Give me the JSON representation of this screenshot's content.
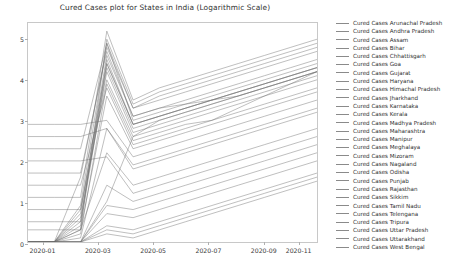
{
  "chart_data": {
    "type": "line",
    "title": "Cured Cases plot for States in India (Logarithmic Scale)",
    "xlabel": "",
    "ylabel": "",
    "ylim": [
      0,
      5.4
    ],
    "yticks": [
      0,
      1,
      2,
      3,
      4,
      5
    ],
    "ytick_labels": [
      "0",
      "1",
      "2",
      "3",
      "4",
      "5"
    ],
    "xtick_labels": [
      "2020-01",
      "2020-03",
      "2020-05",
      "2020-07",
      "2020-09",
      "2020-11"
    ],
    "xtick_positions": [
      0.05,
      0.24,
      0.43,
      0.62,
      0.81,
      0.93
    ],
    "grid": false,
    "legend_position": "right",
    "line_color": "#6e6e6e",
    "x": [
      "2020-01",
      "2020-02",
      "2020-03",
      "2020-04",
      "2020-05",
      "2020-06",
      "2020-07",
      "2020-08",
      "2020-09",
      "2020-10",
      "2020-11",
      "2020-12"
    ],
    "series": [
      {
        "name": "Cured Cases Arunachal Pradesh",
        "values": [
          0.0,
          0.0,
          0.0,
          1.0,
          2.6,
          3.0,
          3.2,
          3.4,
          3.6,
          3.8,
          4.0,
          4.2
        ]
      },
      {
        "name": "Cured Cases Andhra Pradesh",
        "values": [
          0.0,
          0.0,
          1.6,
          4.8,
          3.3,
          3.6,
          3.8,
          4.0,
          4.2,
          4.4,
          4.6,
          4.8
        ]
      },
      {
        "name": "Cured Cases Assam",
        "values": [
          2.9,
          2.9,
          2.9,
          3.0,
          2.1,
          2.3,
          2.5,
          2.7,
          2.9,
          3.1,
          3.3,
          3.5
        ]
      },
      {
        "name": "Cured Cases Bihar",
        "values": [
          0.0,
          0.0,
          0.7,
          4.6,
          3.1,
          3.3,
          3.4,
          3.5,
          3.6,
          3.8,
          4.0,
          4.2
        ]
      },
      {
        "name": "Cured Cases Chhattisgarh",
        "values": [
          2.6,
          2.6,
          2.6,
          2.8,
          1.9,
          2.1,
          2.3,
          2.5,
          2.7,
          2.9,
          3.1,
          3.3
        ]
      },
      {
        "name": "Cured Cases Goa",
        "values": [
          0.0,
          0.0,
          0.3,
          2.2,
          1.4,
          1.6,
          1.8,
          2.0,
          2.2,
          2.4,
          2.6,
          2.8
        ]
      },
      {
        "name": "Cured Cases Gujarat",
        "values": [
          2.3,
          2.3,
          2.3,
          4.9,
          3.0,
          3.2,
          3.4,
          3.6,
          3.8,
          4.0,
          4.2,
          4.4
        ]
      },
      {
        "name": "Cured Cases Haryana",
        "values": [
          0.0,
          0.0,
          0.5,
          4.4,
          2.9,
          3.1,
          3.3,
          3.5,
          3.7,
          3.9,
          4.1,
          4.3
        ]
      },
      {
        "name": "Cured Cases Himachal Pradesh",
        "values": [
          2.0,
          2.0,
          2.0,
          2.1,
          1.2,
          1.4,
          1.6,
          1.8,
          2.0,
          2.2,
          2.4,
          2.6
        ]
      },
      {
        "name": "Cured Cases Jharkhand",
        "values": [
          0.0,
          0.0,
          0.2,
          3.9,
          2.5,
          2.7,
          2.9,
          3.0,
          3.2,
          3.4,
          3.6,
          3.8
        ]
      },
      {
        "name": "Cured Cases Karnataka",
        "values": [
          1.7,
          1.7,
          1.7,
          4.7,
          3.1,
          3.3,
          3.5,
          3.7,
          3.9,
          4.1,
          4.3,
          4.5
        ]
      },
      {
        "name": "Cured Cases Kerala",
        "values": [
          1.4,
          1.4,
          1.4,
          3.8,
          2.4,
          2.6,
          2.8,
          3.0,
          3.3,
          3.6,
          3.9,
          4.2
        ]
      },
      {
        "name": "Cured Cases Madhya Pradesh",
        "values": [
          0.0,
          0.0,
          0.4,
          4.3,
          2.8,
          3.0,
          3.2,
          3.4,
          3.6,
          3.8,
          4.0,
          4.2
        ]
      },
      {
        "name": "Cured Cases Maharashtra",
        "values": [
          1.1,
          1.1,
          1.1,
          5.2,
          3.5,
          3.8,
          4.0,
          4.2,
          4.4,
          4.6,
          4.8,
          5.0
        ]
      },
      {
        "name": "Cured Cases Manipur",
        "values": [
          0.0,
          0.0,
          0.0,
          0.9,
          0.8,
          1.0,
          1.2,
          1.4,
          1.6,
          1.8,
          2.0,
          2.2
        ]
      },
      {
        "name": "Cured Cases Meghalaya",
        "values": [
          0.0,
          0.0,
          0.0,
          0.7,
          0.6,
          0.8,
          1.0,
          1.2,
          1.4,
          1.6,
          1.8,
          2.0
        ]
      },
      {
        "name": "Cured Cases Mizoram",
        "values": [
          0.0,
          0.0,
          0.0,
          0.4,
          0.3,
          0.5,
          0.7,
          0.9,
          1.1,
          1.3,
          1.5,
          1.7
        ]
      },
      {
        "name": "Cured Cases Nagaland",
        "values": [
          0.0,
          0.0,
          0.0,
          0.3,
          0.2,
          0.4,
          0.6,
          0.8,
          1.0,
          1.2,
          1.4,
          1.6
        ]
      },
      {
        "name": "Cured Cases Odisha",
        "values": [
          0.8,
          0.8,
          0.8,
          4.0,
          2.6,
          2.8,
          3.0,
          3.2,
          3.4,
          3.6,
          3.8,
          4.0
        ]
      },
      {
        "name": "Cured Cases Punjab",
        "values": [
          0.0,
          0.0,
          0.3,
          3.6,
          2.3,
          2.5,
          2.7,
          2.9,
          3.1,
          3.3,
          3.5,
          3.7
        ]
      },
      {
        "name": "Cured Cases Rajasthan",
        "values": [
          0.5,
          0.5,
          0.5,
          4.5,
          2.9,
          3.1,
          3.3,
          3.5,
          3.7,
          3.9,
          4.1,
          4.3
        ]
      },
      {
        "name": "Cured Cases Sikkim",
        "values": [
          0.0,
          0.0,
          0.0,
          0.2,
          0.1,
          0.3,
          0.5,
          0.7,
          0.9,
          1.1,
          1.3,
          1.5
        ]
      },
      {
        "name": "Cured Cases Tamil Nadu",
        "values": [
          0.3,
          0.3,
          0.3,
          5.0,
          3.4,
          3.7,
          3.9,
          4.1,
          4.3,
          4.5,
          4.7,
          4.9
        ]
      },
      {
        "name": "Cured Cases Telengana",
        "values": [
          0.0,
          0.0,
          0.6,
          4.2,
          2.7,
          2.9,
          3.1,
          3.3,
          3.5,
          3.7,
          3.9,
          4.1
        ]
      },
      {
        "name": "Cured Cases Tripura",
        "values": [
          0.0,
          0.0,
          0.0,
          1.4,
          1.0,
          1.2,
          1.4,
          1.6,
          1.8,
          2.0,
          2.2,
          2.4
        ]
      },
      {
        "name": "Cured Cases Uttar Pradesh",
        "values": [
          0.0,
          0.0,
          0.9,
          4.9,
          3.3,
          3.5,
          3.7,
          3.9,
          4.1,
          4.3,
          4.5,
          4.7
        ]
      },
      {
        "name": "Cured Cases Uttarakhand",
        "values": [
          0.0,
          0.0,
          0.1,
          2.8,
          1.8,
          2.0,
          2.2,
          2.4,
          2.6,
          2.8,
          3.0,
          3.2
        ]
      },
      {
        "name": "Cured Cases West Bengal",
        "values": [
          0.0,
          0.0,
          0.8,
          4.4,
          2.9,
          3.1,
          3.3,
          3.5,
          3.7,
          3.9,
          4.1,
          4.3
        ]
      }
    ]
  },
  "legend": {
    "items": [
      {
        "label": "Cured Cases Arunachal Pradesh"
      },
      {
        "label": "Cured Cases Andhra Pradesh"
      },
      {
        "label": "Cured Cases Assam"
      },
      {
        "label": "Cured Cases Bihar"
      },
      {
        "label": "Cured Cases Chhattisgarh"
      },
      {
        "label": "Cured Cases Goa"
      },
      {
        "label": "Cured Cases Gujarat"
      },
      {
        "label": "Cured Cases Haryana"
      },
      {
        "label": "Cured Cases Himachal Pradesh"
      },
      {
        "label": "Cured Cases Jharkhand"
      },
      {
        "label": "Cured Cases Karnataka"
      },
      {
        "label": "Cured Cases Kerala"
      },
      {
        "label": "Cured Cases Madhya Pradesh"
      },
      {
        "label": "Cured Cases Maharashtra"
      },
      {
        "label": "Cured Cases Manipur"
      },
      {
        "label": "Cured Cases Meghalaya"
      },
      {
        "label": "Cured Cases Mizoram"
      },
      {
        "label": "Cured Cases Nagaland"
      },
      {
        "label": "Cured Cases Odisha"
      },
      {
        "label": "Cured Cases Punjab"
      },
      {
        "label": "Cured Cases Rajasthan"
      },
      {
        "label": "Cured Cases Sikkim"
      },
      {
        "label": "Cured Cases Tamil Nadu"
      },
      {
        "label": "Cured Cases Telengana"
      },
      {
        "label": "Cured Cases Tripura"
      },
      {
        "label": "Cured Cases Uttar Pradesh"
      },
      {
        "label": "Cured Cases Uttarakhand"
      },
      {
        "label": "Cured Cases West Bengal"
      }
    ]
  }
}
